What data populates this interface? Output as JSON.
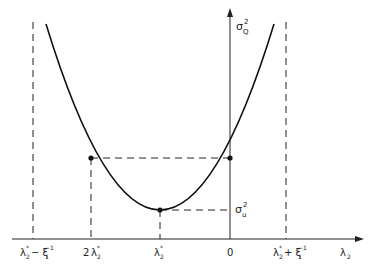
{
  "diagram": {
    "type": "parabola-variance-plot",
    "y_axis_label": {
      "base": "σ",
      "sub": "Q",
      "sup": "2"
    },
    "x_axis_label": {
      "base": "λ",
      "sub": "2"
    },
    "min_label": {
      "base": "σ",
      "sub": "u",
      "sup": "2"
    },
    "x_ticks": [
      {
        "id": "left-bound",
        "text": "λ*₂− ξ₁⁻¹",
        "main": "λ",
        "sup": "*",
        "sub": "2",
        "rest": "− ξ",
        "rest_sub": "1",
        "rest_sup": "−1"
      },
      {
        "id": "two-lambda",
        "text": "2λ*₂",
        "prefix": "2",
        "main": "λ",
        "sup": "*",
        "sub": "2"
      },
      {
        "id": "lambda-star",
        "text": "λ*₂",
        "main": "λ",
        "sup": "*",
        "sub": "2"
      },
      {
        "id": "zero",
        "text": "0"
      },
      {
        "id": "right-bound",
        "text": "λ*₂+ ξ₁⁻¹",
        "main": "λ",
        "sup": "*",
        "sub": "2",
        "rest": "+ ξ",
        "rest_sub": "1",
        "rest_sup": "−1"
      }
    ]
  }
}
